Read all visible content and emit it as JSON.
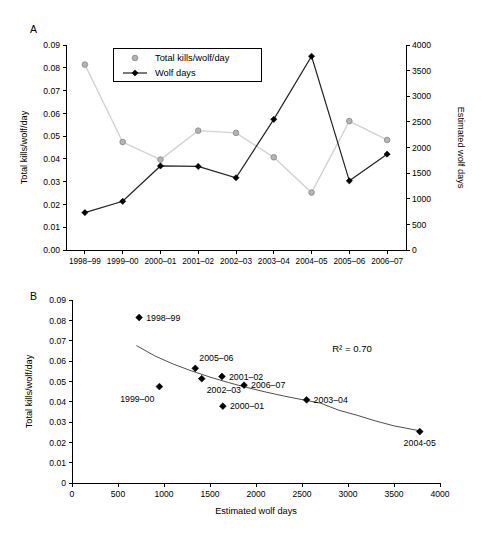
{
  "figure": {
    "panel_a_label": "A",
    "panel_b_label": "B"
  },
  "chart_data": [
    {
      "id": "panel_a",
      "type": "line",
      "title": "",
      "panel": "A",
      "xlabel": "",
      "categories": [
        "1998–99",
        "1999–00",
        "2000–01",
        "2001–02",
        "2002–03",
        "2003–04",
        "2004–05",
        "2005–06",
        "2006–07"
      ],
      "ylabel_left": "Total kills/wolf/day",
      "ylabel_right": "Estimated wolf days",
      "ylim_left": [
        0.0,
        0.09
      ],
      "ylim_right": [
        0,
        4000
      ],
      "yticks_left": [
        "0.00",
        "0.01",
        "0.02",
        "0.03",
        "0.04",
        "0.05",
        "0.06",
        "0.07",
        "0.08",
        "0.09"
      ],
      "ytick_values_left": [
        0.0,
        0.01,
        0.02,
        0.03,
        0.04,
        0.05,
        0.06,
        0.07,
        0.08,
        0.09
      ],
      "yticks_right": [
        "0",
        "500",
        "1000",
        "1500",
        "2000",
        "2500",
        "3000",
        "3500",
        "4000"
      ],
      "ytick_values_right": [
        0,
        500,
        1000,
        1500,
        2000,
        2500,
        3000,
        3500,
        4000
      ],
      "grid": false,
      "legend_position": "top-left-inside",
      "series": [
        {
          "name": "Total kills/wolf/day",
          "axis": "left",
          "marker": "circle",
          "color": "#b4b4b4",
          "line_color": "#d2d2d2",
          "values": [
            0.0814,
            0.0474,
            0.0397,
            0.0524,
            0.0514,
            0.0407,
            0.0252,
            0.0566,
            0.0483
          ]
        },
        {
          "name": "Wolf days",
          "axis": "right",
          "marker": "diamond",
          "color": "#000000",
          "line_color": "#222222",
          "values": [
            730,
            950,
            1640,
            1630,
            1410,
            2550,
            3780,
            1350,
            1870
          ]
        }
      ]
    },
    {
      "id": "panel_b",
      "type": "scatter",
      "panel": "B",
      "xlabel": "Estimated wolf days",
      "ylabel": "Total kills/wolf/day",
      "xlim": [
        0,
        4000
      ],
      "ylim": [
        0,
        0.09
      ],
      "xticks": [
        "0",
        "500",
        "1000",
        "1500",
        "2000",
        "2500",
        "3000",
        "3500",
        "4000"
      ],
      "xtick_values": [
        0,
        500,
        1000,
        1500,
        2000,
        2500,
        3000,
        3500,
        4000
      ],
      "yticks": [
        "0",
        "0.01",
        "0.02",
        "0.03",
        "0.04",
        "0.05",
        "0.06",
        "0.07",
        "0.08",
        "0.09"
      ],
      "ytick_values": [
        0,
        0.01,
        0.02,
        0.03,
        0.04,
        0.05,
        0.06,
        0.07,
        0.08,
        0.09
      ],
      "grid": false,
      "annotation": "R² = 0.70",
      "r_squared": 0.7,
      "points": [
        {
          "label": "1998–99",
          "x": 730,
          "y": 0.0814,
          "label_pos": "right"
        },
        {
          "label": "1999–00",
          "x": 950,
          "y": 0.0474,
          "label_pos": "below-left"
        },
        {
          "label": "2000–01",
          "x": 1640,
          "y": 0.0378,
          "label_pos": "right"
        },
        {
          "label": "2001–02",
          "x": 1630,
          "y": 0.0524,
          "label_pos": "right"
        },
        {
          "label": "2002–03",
          "x": 1410,
          "y": 0.0513,
          "label_pos": "below-left"
        },
        {
          "label": "2003–04",
          "x": 2550,
          "y": 0.0409,
          "label_pos": "right"
        },
        {
          "label": "2004-05",
          "x": 3780,
          "y": 0.0253,
          "label_pos": "below"
        },
        {
          "label": "2005–06",
          "x": 1340,
          "y": 0.0564,
          "label_pos": "above-right"
        },
        {
          "label": "2006–07",
          "x": 1870,
          "y": 0.0481,
          "label_pos": "right"
        }
      ],
      "fit_curve": {
        "type": "power",
        "x_start": 700,
        "x_end": 3800,
        "points": [
          {
            "x": 700,
            "y": 0.0676
          },
          {
            "x": 900,
            "y": 0.0625
          },
          {
            "x": 1100,
            "y": 0.0585
          },
          {
            "x": 1300,
            "y": 0.0551
          },
          {
            "x": 1500,
            "y": 0.0521
          },
          {
            "x": 1700,
            "y": 0.0494
          },
          {
            "x": 1900,
            "y": 0.047
          },
          {
            "x": 2100,
            "y": 0.0448
          },
          {
            "x": 2300,
            "y": 0.0428
          },
          {
            "x": 2500,
            "y": 0.041
          },
          {
            "x": 2700,
            "y": 0.0393
          },
          {
            "x": 2900,
            "y": 0.0358
          },
          {
            "x": 3100,
            "y": 0.0333
          },
          {
            "x": 3300,
            "y": 0.0305
          },
          {
            "x": 3500,
            "y": 0.0281
          },
          {
            "x": 3800,
            "y": 0.0255
          }
        ]
      }
    }
  ]
}
